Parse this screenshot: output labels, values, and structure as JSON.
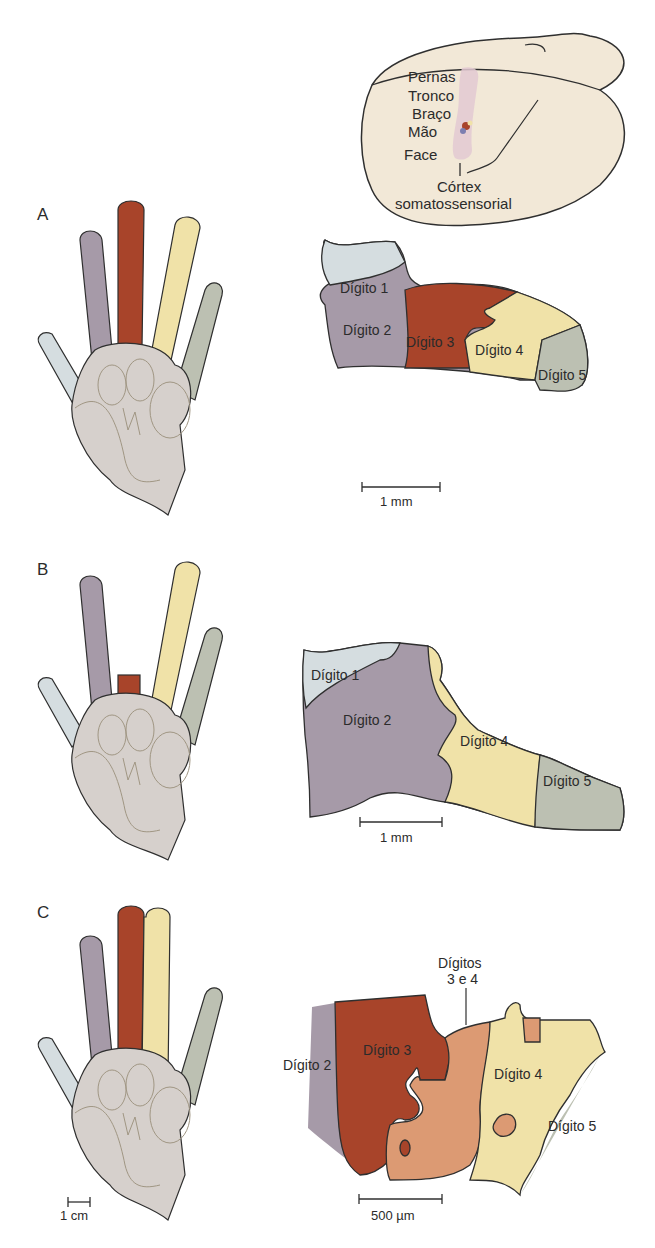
{
  "colors": {
    "digit1": "#d5dde0",
    "digit2": "#a69aa8",
    "digit3": "#a8442a",
    "digit4": "#f0e2a8",
    "digit5": "#bcc0b2",
    "digits3and4": "#dc9a73",
    "palm": "#d6d0cc",
    "brain": "#f2e8d7",
    "outline": "#2f2f2f",
    "cortex_strip": "#e3c9d2"
  },
  "brain_inset": {
    "labels": [
      "Pernas",
      "Tronco",
      "Braço",
      "Mão",
      "Face"
    ],
    "cortex_label_line1": "Córtex",
    "cortex_label_line2": "somatossensorial"
  },
  "panels": [
    {
      "letter": "A",
      "map_labels": [
        "Dígito 1",
        "Dígito 2",
        "Dígito 3",
        "Dígito 4",
        "Dígito 5"
      ],
      "scale": "1 mm"
    },
    {
      "letter": "B",
      "map_labels": [
        "Dígito 1",
        "Dígito 2",
        "Dígito 4",
        "Dígito 5"
      ],
      "scale": "1 mm"
    },
    {
      "letter": "C",
      "map_labels": [
        "Dígito 2",
        "Dígito 3",
        "Dígito 4",
        "Dígito 5"
      ],
      "callout_line1": "Dígitos",
      "callout_line2": "3 e 4",
      "scale": "500 µm",
      "hand_scale": "1 cm"
    }
  ]
}
